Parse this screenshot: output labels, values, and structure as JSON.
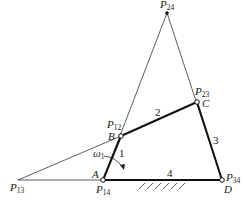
{
  "diagram": {
    "type": "four-bar linkage instantaneous centers",
    "points": {
      "P24": {
        "label": "P",
        "sub": "24"
      },
      "P23": {
        "label": "P",
        "sub": "23",
        "joint": "C"
      },
      "P12": {
        "label": "P",
        "sub": "12",
        "joint": "B"
      },
      "P13": {
        "label": "P",
        "sub": "13"
      },
      "P14": {
        "label": "P",
        "sub": "14",
        "joint": "A"
      },
      "P34": {
        "label": "P",
        "sub": "34",
        "joint": "D"
      }
    },
    "joints": {
      "A": "A",
      "B": "B",
      "C": "C",
      "D": "D"
    },
    "links": {
      "l1": "1",
      "l2": "2",
      "l3": "3",
      "l4": "4"
    },
    "omega": {
      "symbol": "ω",
      "sub": "1"
    }
  }
}
